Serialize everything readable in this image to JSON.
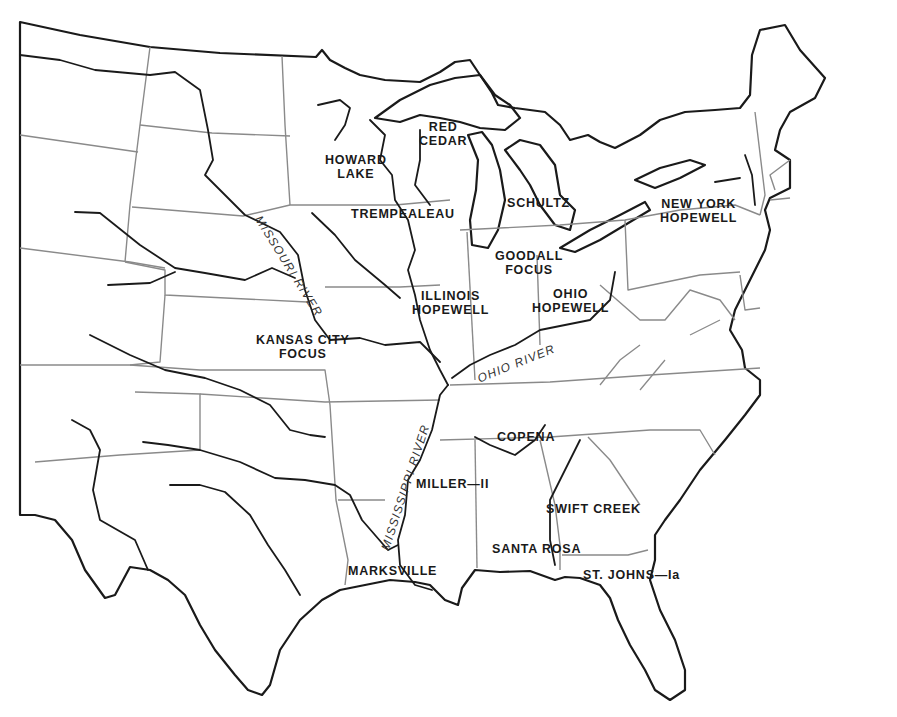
{
  "map": {
    "title": "Hopewell Interaction Sphere regional traditions, eastern United States",
    "colors": {
      "coastline": "#1a1a1a",
      "state_border": "#8a8a8a",
      "background": "#ffffff"
    },
    "sites": [
      {
        "id": "howard-lake",
        "line1": "HOWARD",
        "line2": "LAKE",
        "x": 357,
        "y": 152
      },
      {
        "id": "red-cedar",
        "line1": "RED",
        "line2": "CEDAR",
        "x": 441,
        "y": 120
      },
      {
        "id": "trempealeau",
        "line1": "TREMPEALEAU",
        "line2": "",
        "x": 402,
        "y": 213
      },
      {
        "id": "schultz",
        "line1": "SCHULTZ",
        "line2": "",
        "x": 540,
        "y": 202
      },
      {
        "id": "new-york-hopewell",
        "line1": "NEW YORK",
        "line2": "HOPEWELL",
        "x": 708,
        "y": 203
      },
      {
        "id": "goodall-focus",
        "line1": "GOODALL",
        "line2": "FOCUS",
        "x": 532,
        "y": 255
      },
      {
        "id": "illinois-hopewell",
        "line1": "ILLINOIS",
        "line2": "HOPEWELL",
        "x": 452,
        "y": 294
      },
      {
        "id": "ohio-hopewell",
        "line1": "OHIO",
        "line2": "HOPEWELL",
        "x": 570,
        "y": 288
      },
      {
        "id": "kansas-city-focus",
        "line1": "KANSAS CITY",
        "line2": "FOCUS",
        "x": 309,
        "y": 333
      },
      {
        "id": "copena",
        "line1": "COPENA",
        "line2": "",
        "x": 527,
        "y": 436
      },
      {
        "id": "miller-ii",
        "line1": "MILLER—II",
        "line2": "",
        "x": 459,
        "y": 483
      },
      {
        "id": "swift-creek",
        "line1": "SWIFT CREEK",
        "line2": "",
        "x": 596,
        "y": 508
      },
      {
        "id": "santa-rosa",
        "line1": "SANTA ROSA",
        "line2": "",
        "x": 543,
        "y": 548
      },
      {
        "id": "marksville",
        "line1": "MARKSVILLE",
        "line2": "",
        "x": 395,
        "y": 570
      },
      {
        "id": "st-johns-ia",
        "line1": "ST. JOHNS—Ia",
        "line2": "",
        "x": 621,
        "y": 574
      }
    ],
    "rivers": [
      {
        "id": "missouri-river",
        "label": "MISSOURI RIVER"
      },
      {
        "id": "ohio-river",
        "label": "OHIO RIVER"
      },
      {
        "id": "mississippi-river",
        "label": "MISSISSIPPI RIVER"
      }
    ]
  }
}
